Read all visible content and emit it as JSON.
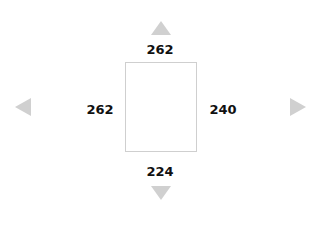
{
  "margins": {
    "top": "262",
    "left": "262",
    "right": "240",
    "bottom": "224"
  },
  "icons": {
    "up": "triangle-up-icon",
    "down": "triangle-down-icon",
    "left": "triangle-left-icon",
    "right": "triangle-right-icon"
  },
  "colors": {
    "arrow": "#d0d0d0",
    "box_border": "#cfcfcf",
    "text": "#111111"
  }
}
